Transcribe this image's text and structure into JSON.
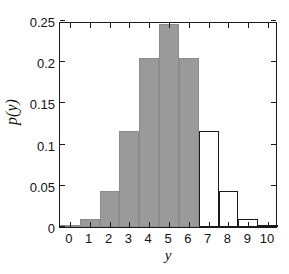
{
  "chart_data": {
    "type": "bar",
    "title": "",
    "xlabel": "y",
    "ylabel": "p(y)",
    "categories": [
      "0",
      "1",
      "2",
      "3",
      "4",
      "5",
      "6",
      "7",
      "8",
      "9",
      "10"
    ],
    "x": [
      0,
      1,
      2,
      3,
      4,
      5,
      6,
      7,
      8,
      9,
      10
    ],
    "values": [
      0.001,
      0.01,
      0.044,
      0.117,
      0.205,
      0.246,
      0.205,
      0.117,
      0.044,
      0.01,
      0.001
    ],
    "bar_styles": [
      "filled",
      "filled",
      "filled",
      "filled",
      "filled",
      "filled",
      "filled",
      "hollow",
      "hollow",
      "hollow",
      "hollow"
    ],
    "xlim": [
      -0.5,
      10.5
    ],
    "ylim": [
      0,
      0.25
    ],
    "ytick_values": [
      0,
      0.05,
      0.1,
      0.15,
      0.2,
      0.25
    ],
    "ytick_labels": [
      "0",
      "0.05",
      "0.1",
      "0.15",
      "0.2",
      "0.25"
    ],
    "xtick_values": [
      0,
      1,
      2,
      3,
      4,
      5,
      6,
      7,
      8,
      9,
      10
    ],
    "xtick_labels": [
      "0",
      "1",
      "2",
      "3",
      "4",
      "5",
      "6",
      "7",
      "8",
      "9",
      "10"
    ],
    "grid": false,
    "legend": null,
    "legend_position": "none",
    "colors": {
      "filled_bar": "#9a9a9a",
      "hollow_bar": "#ffffff",
      "bar_outline": "#1a1a1a",
      "axis": "#1a1a1a",
      "text": "#111111",
      "background": "#ffffff"
    }
  }
}
